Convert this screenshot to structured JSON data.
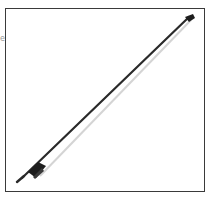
{
  "image": {
    "subject": "violin bow",
    "background_color": "#ffffff",
    "frame_color": "#3a3a3a",
    "stick_color": "#2a2a2a",
    "hair_color": "#d8d8d8",
    "frog_color": "#1e1e1e"
  },
  "edge_fragment": {
    "text": "e"
  }
}
